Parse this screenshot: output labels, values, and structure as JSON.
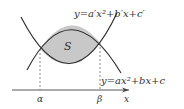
{
  "diagram": {
    "upper_curve_label": "y=a′x²+b′x+c′",
    "lower_curve_label": "y=ax²+bx+c",
    "region_label": "S",
    "alpha_label": "α",
    "beta_label": "β",
    "x_axis_label": "x",
    "colors": {
      "curve": "#333333",
      "fill": "#c8c8c8",
      "dashed": "#555555",
      "axis": "#444444"
    }
  }
}
